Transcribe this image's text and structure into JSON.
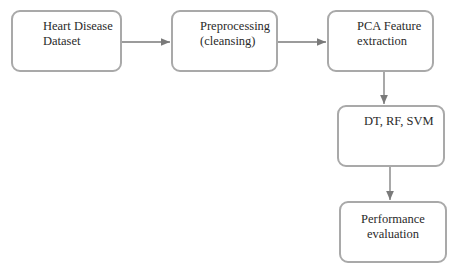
{
  "diagram": {
    "type": "flowchart",
    "nodes": [
      {
        "id": "n1",
        "label": "Heart Disease\nDataset"
      },
      {
        "id": "n2",
        "label": "Preprocessing\n(cleansing)"
      },
      {
        "id": "n3",
        "label": "PCA Feature\nextraction"
      },
      {
        "id": "n4",
        "label": "DT, RF, SVM"
      },
      {
        "id": "n5",
        "label": "Performance\nevaluation"
      }
    ],
    "edges": [
      {
        "from": "n1",
        "to": "n2"
      },
      {
        "from": "n2",
        "to": "n3"
      },
      {
        "from": "n3",
        "to": "n4"
      },
      {
        "from": "n4",
        "to": "n5"
      }
    ],
    "colors": {
      "border": "#a9a9a9",
      "arrow": "#7a7a7a",
      "text": "#2a2a2a"
    }
  }
}
